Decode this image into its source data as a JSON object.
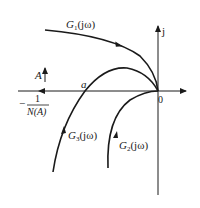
{
  "diagram": {
    "type": "nyquist-describing-function",
    "axes": {
      "imag_label": "j",
      "origin_label": "0"
    },
    "curves": [
      {
        "id": "G1",
        "label_main": "G",
        "label_sub": "1",
        "label_tail": "(jω)"
      },
      {
        "id": "G3",
        "label_main": "G",
        "label_sub": "3",
        "label_tail": "(jω)"
      },
      {
        "id": "G2",
        "label_main": "G",
        "label_sub": "2",
        "label_tail": "(jω)"
      }
    ],
    "describing_function": {
      "minus": "−",
      "numerator": "1",
      "denominator": "N(A)"
    },
    "amplitude_label": "A",
    "intersection_label": "a",
    "colors": {
      "stroke": "#1a1a1a",
      "background": "#ffffff"
    }
  }
}
